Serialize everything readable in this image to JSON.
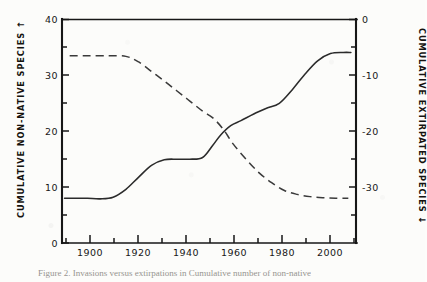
{
  "figure": {
    "caption": "Figure 2.  Invasions versus extirpations in Cumulative number of non-native",
    "caption_visible_note": "clipped-at-image-bottom"
  },
  "axes": {
    "left_title": "CUMULATIVE NON-NATIVE SPECIES",
    "left_arrow": "↑",
    "right_title": "CUMULATIVE EXTIRPATED SPECIES",
    "right_arrow": "↓",
    "left_ticks": [
      "0",
      "10",
      "20",
      "30",
      "40"
    ],
    "right_ticks": [
      "0",
      "-10",
      "-20",
      "-30"
    ],
    "x_ticks": [
      "1900",
      "1920",
      "1940",
      "1960",
      "1980",
      "2000"
    ]
  },
  "colors": {
    "ink": "#1a1a1a",
    "paper": "#fcfcfa",
    "curve": "#2b2b2b"
  },
  "chart_data": {
    "type": "line",
    "title": "",
    "xlabel": "",
    "ylabel": "CUMULATIVE NON-NATIVE SPECIES",
    "y2label": "CUMULATIVE EXTIRPATED SPECIES",
    "xlim": [
      1890,
      2005
    ],
    "ylim": [
      0,
      40
    ],
    "y2lim": [
      -40,
      0
    ],
    "grid": false,
    "legend": "none",
    "x_tick_values": [
      1900,
      1920,
      1940,
      1960,
      1980,
      2000
    ],
    "x_minor_tick_interval": 10,
    "left_tick_values": [
      0,
      10,
      20,
      30,
      40
    ],
    "left_minor_tick_interval": 5,
    "right_tick_values": [
      0,
      -10,
      -20,
      -30
    ],
    "right_minor_tick_interval": 5,
    "series": [
      {
        "name": "Cumulative non-native species",
        "style": "solid",
        "axis": "left",
        "x": [
          1891,
          1896,
          1900,
          1905,
          1910,
          1915,
          1920,
          1925,
          1930,
          1935,
          1940,
          1945,
          1949,
          1952,
          1956,
          1960,
          1965,
          1970,
          1975,
          1980,
          1985,
          1990,
          1995,
          2000,
          2003
        ],
        "values": [
          8.0,
          8.0,
          8.0,
          7.9,
          8.2,
          9.6,
          11.8,
          13.9,
          14.9,
          15.0,
          15.0,
          15.3,
          17.5,
          19.3,
          21.0,
          21.9,
          23.1,
          24.1,
          25.0,
          27.4,
          30.2,
          32.6,
          33.9,
          34.1,
          34.1
        ]
      },
      {
        "name": "Cumulative extirpated species",
        "style": "dashed",
        "axis": "right",
        "x": [
          1893,
          1900,
          1908,
          1915,
          1920,
          1925,
          1930,
          1935,
          1940,
          1945,
          1949,
          1953,
          1957,
          1962,
          1967,
          1972,
          1977,
          1982,
          1987,
          1992,
          1997,
          2002
        ],
        "values": [
          -6.5,
          -6.5,
          -6.5,
          -6.6,
          -7.6,
          -9.3,
          -11.0,
          -12.8,
          -14.6,
          -16.4,
          -17.6,
          -19.6,
          -22.3,
          -25.0,
          -27.4,
          -29.2,
          -30.6,
          -31.3,
          -31.7,
          -31.9,
          -32.0,
          -32.0
        ]
      }
    ],
    "annotations": [
      {
        "text": "curves cross",
        "x": 1949,
        "left_value": 17.5,
        "right_value": -17.6
      }
    ]
  }
}
